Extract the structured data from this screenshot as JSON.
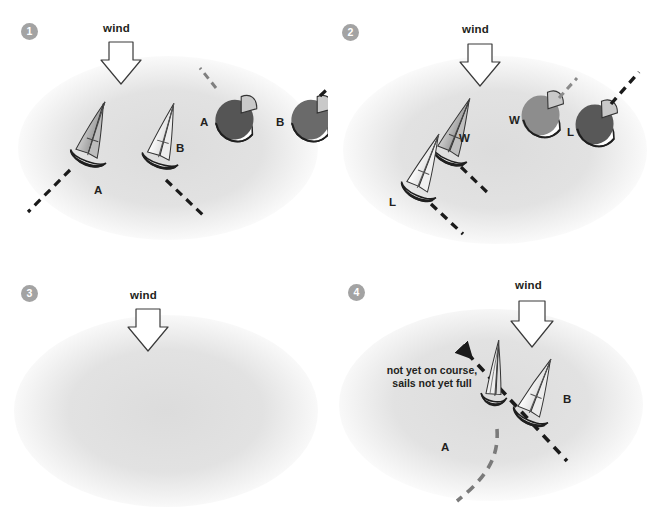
{
  "figure": {
    "background_blob_color": "#e3e3e3",
    "page_background": "#ffffff",
    "caption": ""
  },
  "icons": {
    "wind_arrow": "down-arrow-icon",
    "dashed_course": "dashed-course-line-icon",
    "curved_arrow": "curved-turn-arrow-icon",
    "boat_side": "sailboat-side-view-icon",
    "boat_top": "sailboat-top-view-icon"
  },
  "colors": {
    "badge_fill": "#a3a3a3",
    "badge_text": "#ffffff",
    "hull_outline": "#231f20",
    "sail_light": "#f4f4f4",
    "sail_mid": "#b8b8b8",
    "sail_dark": "#8f8f8f",
    "hull_top_light": "#8c8c8c",
    "hull_top_dark": "#555555",
    "dashed_black": "#1a1a1a",
    "dashed_gray": "#8a8a8a",
    "curve_arrow": "#7a7a7a",
    "text": "#231f20"
  },
  "panels": [
    {
      "id": "panel-1",
      "step": "1",
      "wind_label": "wind",
      "boats": [
        {
          "label": "A",
          "view": "side",
          "sail": "mid",
          "note": "beating close-hauled, port side"
        },
        {
          "label": "B",
          "view": "side",
          "sail": "light",
          "note": "beating close-hauled, port side"
        },
        {
          "label": "A",
          "view": "top",
          "sail": "dark",
          "note": "top view, dashed course to windward"
        },
        {
          "label": "B",
          "view": "top",
          "sail": "dark",
          "note": "top view, dashed course to windward"
        }
      ]
    },
    {
      "id": "panel-2",
      "step": "2",
      "wind_label": "wind",
      "boats": [
        {
          "label": "W",
          "view": "side",
          "sail": "mid",
          "note": "windward boat"
        },
        {
          "label": "L",
          "view": "side",
          "sail": "light",
          "note": "leeward boat"
        },
        {
          "label": "W",
          "view": "top",
          "sail": "mid",
          "note": "windward boat, top view"
        },
        {
          "label": "L",
          "view": "top",
          "sail": "dark",
          "note": "leeward boat, top view"
        }
      ]
    },
    {
      "id": "panel-3",
      "step": "3",
      "wind_label": "wind",
      "boats": [
        {
          "label": "B",
          "view": "side",
          "sail": "light",
          "note": "bearing away"
        },
        {
          "label": "A",
          "view": "side",
          "sail": "mid",
          "note": "bearing away"
        },
        {
          "label": "A",
          "view": "top",
          "sail": "dark",
          "note": "top view, turning"
        },
        {
          "label": "B",
          "view": "top",
          "sail": "dark",
          "note": "top view, turning"
        }
      ]
    },
    {
      "id": "panel-4",
      "step": "4",
      "wind_label": "wind",
      "annotation": "not yet on course,\nsails not yet full",
      "annotation_line_1": "not yet on course,",
      "annotation_line_2": "sails not yet full",
      "boats": [
        {
          "label": "A",
          "view": "side",
          "sail": "light",
          "note": "head to wind, sails luffing"
        },
        {
          "label": "B",
          "view": "side",
          "sail": "light",
          "note": "on the new course"
        }
      ]
    }
  ]
}
